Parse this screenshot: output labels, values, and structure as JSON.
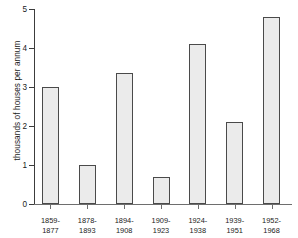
{
  "chart_data": {
    "type": "bar",
    "title": "",
    "subtitle": "",
    "xlabel": "",
    "ylabel": "thousands of houses per annum",
    "categories": [
      "1859-\n1877",
      "1878-\n1893",
      "1894-\n1908",
      "1909-\n1923",
      "1924-\n1938",
      "1939-\n1951",
      "1952-\n1968"
    ],
    "category_lines": [
      [
        "1859-",
        "1877"
      ],
      [
        "1878-",
        "1893"
      ],
      [
        "1894-",
        "1908"
      ],
      [
        "1909-",
        "1923"
      ],
      [
        "1924-",
        "1938"
      ],
      [
        "1939-",
        "1951"
      ],
      [
        "1952-",
        "1968"
      ]
    ],
    "values": [
      3.0,
      1.0,
      3.35,
      0.7,
      4.1,
      2.1,
      4.8
    ],
    "ylim": [
      0,
      5
    ],
    "yticks": [
      0,
      1,
      2,
      3,
      4,
      5
    ],
    "ytick_labels": [
      "0",
      "1",
      "2",
      "3",
      "4",
      "5"
    ],
    "grid": false,
    "legend": null,
    "bar_fill_color": "#ebebeb",
    "bar_edge_color": "#4a4a4a",
    "axis_color": "#3c3c3c",
    "background_color": "#ffffff"
  }
}
